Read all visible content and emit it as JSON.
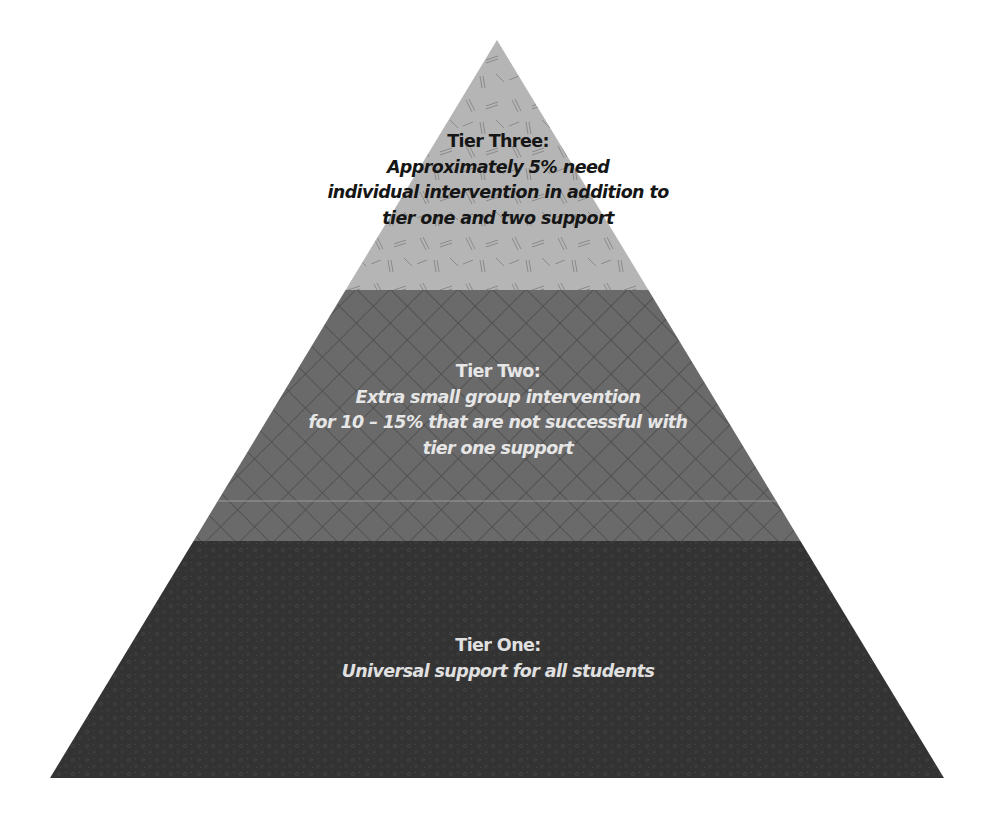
{
  "diagram": {
    "type": "pyramid",
    "tiers": [
      {
        "id": "tier-three",
        "level": 3,
        "title": "Tier Three:",
        "description": "Approximately 5% need\nindividual intervention in addition to\ntier one and two support",
        "fill_color": "#b4b4b4",
        "text_color": "#161616",
        "pattern": "dashes"
      },
      {
        "id": "tier-two",
        "level": 2,
        "title": "Tier Two:",
        "description": "Extra small group intervention\nfor 10 – 15% that are not successful with\ntier one support",
        "fill_color": "#6c6c6c",
        "text_color": "#e6e6e6",
        "pattern": "crosshatch"
      },
      {
        "id": "tier-one",
        "level": 1,
        "title": "Tier One:",
        "description": "Universal support for all students",
        "fill_color": "#353535",
        "text_color": "#e0e0e0",
        "pattern": "speckle"
      }
    ]
  }
}
